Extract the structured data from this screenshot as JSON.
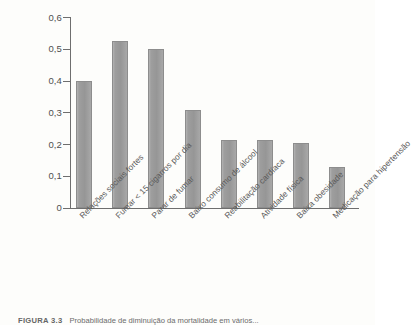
{
  "figure": {
    "caption_label": "FIGURA 3.3",
    "caption_text": "Probabilidade de diminuição da mortalidade em vários..."
  },
  "chart_data": {
    "type": "bar",
    "title": "",
    "xlabel": "",
    "ylabel": "",
    "ylim": [
      0,
      0.6
    ],
    "grid": false,
    "legend": "none",
    "decimal_separator": ",",
    "categories": [
      "Relações sociais fortes",
      "Fumar < 15 cigarros por dia",
      "Parar de fumar",
      "Baixo consumo de álcool",
      "Reabilitação cardíaca",
      "Atividade física",
      "Baixa obesidade",
      "Medicação para hipertensão"
    ],
    "values": [
      0.4,
      0.525,
      0.5,
      0.31,
      0.215,
      0.215,
      0.205,
      0.13
    ],
    "value_labels": [
      "0,40",
      "0,525",
      "0,50",
      "0,31",
      "0,215",
      "0,215",
      "0,205",
      "0,13"
    ],
    "yticks": [
      0.6,
      0.5,
      0.4,
      0.3,
      0.2,
      0.1,
      0
    ],
    "ytick_labels": [
      "0,6",
      "0,5",
      "0,4",
      "0,3",
      "0,2",
      "0,1",
      "0"
    ],
    "bar_color": "#9e9e9e",
    "axis_color": "#6e6e6e",
    "background": "#fdfdfb"
  }
}
